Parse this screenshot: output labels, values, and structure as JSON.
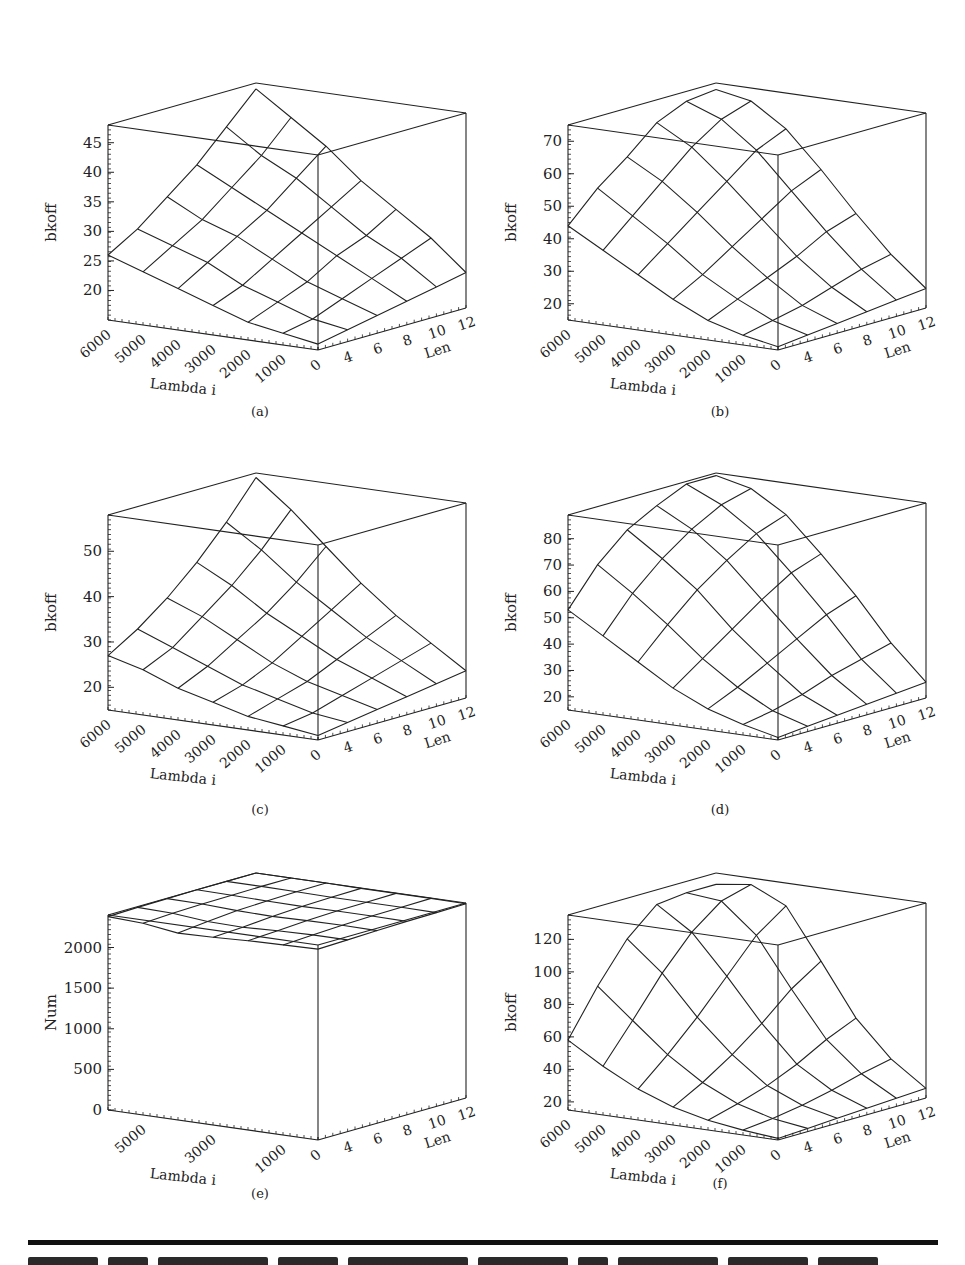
{
  "figure": {
    "panels": [
      "a",
      "b",
      "c",
      "d",
      "e",
      "f"
    ]
  },
  "chart_data": [
    {
      "id": "a",
      "type": "surface3d",
      "caption": "(a)",
      "zlabel": "bkoff",
      "xlabel": "Lambda i",
      "ylabel": "Len",
      "x_ticks": [
        "6000",
        "5000",
        "4000",
        "3000",
        "2000",
        "1000",
        "0"
      ],
      "y_ticks": [
        "4",
        "6",
        "8",
        "10",
        "12"
      ],
      "z_ticks": [
        "20",
        "25",
        "30",
        "35",
        "40",
        "45"
      ],
      "zlim": [
        15,
        48
      ],
      "x": [
        6000,
        5000,
        4000,
        3000,
        2000,
        1000,
        0
      ],
      "y": [
        2,
        4,
        6,
        8,
        10,
        12
      ],
      "z": [
        [
          26,
          29,
          33,
          37,
          42,
          47
        ],
        [
          24,
          27,
          30,
          34,
          38,
          43
        ],
        [
          22,
          25,
          28,
          31,
          35,
          39
        ],
        [
          20,
          22,
          25,
          28,
          31,
          34
        ],
        [
          18,
          20,
          22,
          25,
          27,
          30
        ],
        [
          17,
          18,
          20,
          22,
          24,
          26
        ],
        [
          16,
          17,
          18,
          19,
          20,
          21
        ]
      ]
    },
    {
      "id": "b",
      "type": "surface3d",
      "caption": "(b)",
      "zlabel": "bkoff",
      "xlabel": "Lambda i",
      "ylabel": "Len",
      "x_ticks": [
        "6000",
        "5000",
        "4000",
        "3000",
        "2000",
        "1000",
        "0"
      ],
      "y_ticks": [
        "4",
        "6",
        "8",
        "10",
        "12"
      ],
      "z_ticks": [
        "20",
        "30",
        "40",
        "50",
        "60",
        "70"
      ],
      "zlim": [
        15,
        75
      ],
      "x": [
        6000,
        5000,
        4000,
        3000,
        2000,
        1000,
        0
      ],
      "y": [
        2,
        4,
        6,
        8,
        10,
        12
      ],
      "z": [
        [
          44,
          53,
          60,
          68,
          72,
          73
        ],
        [
          38,
          46,
          54,
          62,
          68,
          71
        ],
        [
          32,
          39,
          46,
          53,
          60,
          64
        ],
        [
          26,
          31,
          37,
          43,
          49,
          53
        ],
        [
          21,
          25,
          29,
          33,
          38,
          41
        ],
        [
          18,
          20,
          22,
          25,
          28,
          30
        ],
        [
          16,
          17,
          18,
          19,
          20,
          21
        ]
      ]
    },
    {
      "id": "c",
      "type": "surface3d",
      "caption": "(c)",
      "zlabel": "bkoff",
      "xlabel": "Lambda i",
      "ylabel": "Len",
      "x_ticks": [
        "6000",
        "5000",
        "4000",
        "3000",
        "2000",
        "1000",
        "0"
      ],
      "y_ticks": [
        "4",
        "6",
        "8",
        "10",
        "12"
      ],
      "z_ticks": [
        "20",
        "30",
        "40",
        "50"
      ],
      "zlim": [
        15,
        58
      ],
      "x": [
        6000,
        5000,
        4000,
        3000,
        2000,
        1000,
        0
      ],
      "y": [
        2,
        4,
        6,
        8,
        10,
        12
      ],
      "z": [
        [
          27,
          31,
          36,
          42,
          49,
          57
        ],
        [
          25,
          28,
          33,
          38,
          44,
          51
        ],
        [
          22,
          25,
          29,
          33,
          38,
          44
        ],
        [
          20,
          22,
          25,
          29,
          33,
          37
        ],
        [
          18,
          20,
          22,
          25,
          28,
          31
        ],
        [
          17,
          18,
          20,
          22,
          24,
          26
        ],
        [
          16,
          17,
          18,
          19,
          20,
          21
        ]
      ]
    },
    {
      "id": "d",
      "type": "surface3d",
      "caption": "(d)",
      "zlabel": "bkoff",
      "xlabel": "Lambda i",
      "ylabel": "Len",
      "x_ticks": [
        "6000",
        "5000",
        "4000",
        "3000",
        "2000",
        "1000",
        "0"
      ],
      "y_ticks": [
        "4",
        "6",
        "8",
        "10",
        "12"
      ],
      "z_ticks": [
        "20",
        "30",
        "40",
        "50",
        "60",
        "70",
        "80"
      ],
      "zlim": [
        15,
        89
      ],
      "x": [
        6000,
        5000,
        4000,
        3000,
        2000,
        1000,
        0
      ],
      "y": [
        2,
        4,
        6,
        8,
        10,
        12
      ],
      "z": [
        [
          53,
          67,
          77,
          83,
          88,
          88
        ],
        [
          45,
          58,
          68,
          76,
          82,
          85
        ],
        [
          37,
          48,
          58,
          66,
          73,
          77
        ],
        [
          29,
          37,
          45,
          53,
          60,
          64
        ],
        [
          23,
          28,
          34,
          40,
          46,
          50
        ],
        [
          19,
          21,
          24,
          28,
          31,
          34
        ],
        [
          16,
          17,
          18,
          19,
          20,
          21
        ]
      ]
    },
    {
      "id": "e",
      "type": "surface3d",
      "caption": "(e)",
      "zlabel": "Num",
      "xlabel": "Lambda i",
      "ylabel": "Len",
      "x_ticks": [
        "5000",
        "3000",
        "1000",
        "0"
      ],
      "y_ticks": [
        "4",
        "6",
        "8",
        "10",
        "12"
      ],
      "z_ticks": [
        "0",
        "500",
        "1000",
        "1500",
        "2000"
      ],
      "zlim": [
        0,
        2400
      ],
      "x": [
        6000,
        5000,
        4000,
        3000,
        2000,
        1000,
        0
      ],
      "y": [
        2,
        4,
        6,
        8,
        10,
        12
      ],
      "z": [
        [
          2380,
          2390,
          2395,
          2400,
          2400,
          2400
        ],
        [
          2360,
          2380,
          2390,
          2395,
          2400,
          2400
        ],
        [
          2300,
          2340,
          2370,
          2385,
          2395,
          2400
        ],
        [
          2310,
          2330,
          2360,
          2380,
          2390,
          2395
        ],
        [
          2330,
          2350,
          2370,
          2385,
          2390,
          2395
        ],
        [
          2340,
          2360,
          2375,
          2385,
          2390,
          2395
        ],
        [
          2350,
          2360,
          2370,
          2380,
          2385,
          2390
        ]
      ]
    },
    {
      "id": "f",
      "type": "surface3d",
      "caption": "(f)",
      "zlabel": "bkoff",
      "xlabel": "Lambda i",
      "ylabel": "Len",
      "x_ticks": [
        "6000",
        "5000",
        "4000",
        "3000",
        "2000",
        "1000",
        "0"
      ],
      "y_ticks": [
        "4",
        "6",
        "8",
        "10",
        "12"
      ],
      "z_ticks": [
        "20",
        "40",
        "60",
        "80",
        "100",
        "120"
      ],
      "zlim": [
        15,
        135
      ],
      "x": [
        6000,
        5000,
        4000,
        3000,
        2000,
        1000,
        0
      ],
      "y": [
        2,
        4,
        6,
        8,
        10,
        12
      ],
      "z": [
        [
          58,
          86,
          110,
          126,
          128,
          128
        ],
        [
          45,
          68,
          92,
          112,
          126,
          131
        ],
        [
          34,
          50,
          68,
          88,
          108,
          121
        ],
        [
          26,
          36,
          48,
          62,
          78,
          90
        ],
        [
          21,
          26,
          32,
          40,
          50,
          58
        ],
        [
          18,
          20,
          23,
          27,
          32,
          36
        ],
        [
          16,
          17,
          18,
          19,
          20,
          21
        ]
      ]
    }
  ],
  "layout_positions": {
    "a": {
      "left": 40,
      "top": 60
    },
    "b": {
      "left": 500,
      "top": 60
    },
    "c": {
      "left": 40,
      "top": 450
    },
    "d": {
      "left": 500,
      "top": 450
    },
    "e": {
      "left": 40,
      "top": 850
    },
    "f": {
      "left": 500,
      "top": 850
    }
  },
  "colors": {
    "line": "#222222",
    "background": "#ffffff"
  }
}
